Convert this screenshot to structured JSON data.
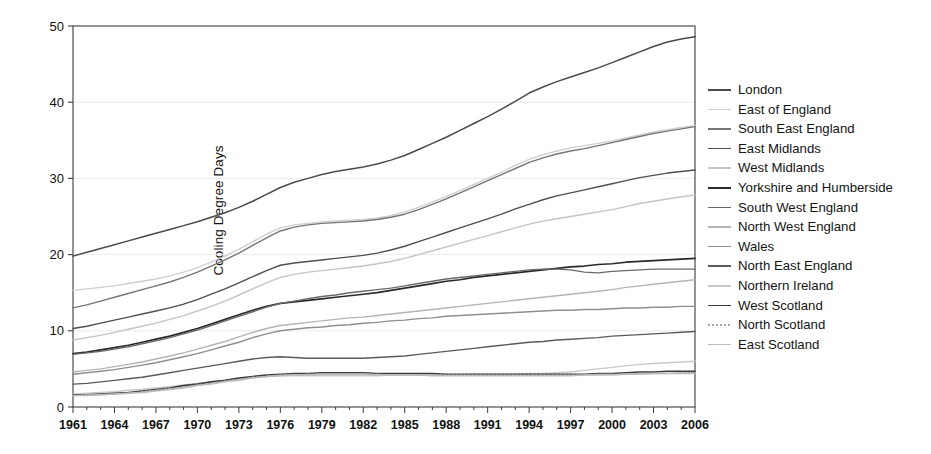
{
  "chart_data": {
    "type": "line",
    "title": "",
    "xlabel": "",
    "ylabel": "Cooling Degree Days",
    "xlim": [
      1961,
      2006
    ],
    "ylim": [
      0,
      50
    ],
    "yticks": [
      0,
      10,
      20,
      30,
      40,
      50
    ],
    "xticks": [
      1961,
      1964,
      1967,
      1970,
      1973,
      1976,
      1979,
      1982,
      1985,
      1988,
      1991,
      1994,
      1997,
      2000,
      2003,
      2006
    ],
    "grid": true,
    "legend_position": "right",
    "x": [
      1961,
      1962,
      1963,
      1964,
      1965,
      1966,
      1967,
      1968,
      1969,
      1970,
      1971,
      1972,
      1973,
      1974,
      1975,
      1976,
      1977,
      1978,
      1979,
      1980,
      1981,
      1982,
      1983,
      1984,
      1985,
      1986,
      1987,
      1988,
      1989,
      1990,
      1991,
      1992,
      1993,
      1994,
      1995,
      1996,
      1997,
      1998,
      1999,
      2000,
      2001,
      2002,
      2003,
      2004,
      2005,
      2006
    ],
    "series": [
      {
        "name": "London",
        "color": "#4a4a4a",
        "width": 1.5,
        "dash": "none",
        "values": [
          19.8,
          20.3,
          20.8,
          21.3,
          21.8,
          22.3,
          22.8,
          23.3,
          23.8,
          24.3,
          24.9,
          25.5,
          26.2,
          27.0,
          27.9,
          28.8,
          29.5,
          30.0,
          30.5,
          30.9,
          31.2,
          31.5,
          31.9,
          32.4,
          33.0,
          33.8,
          34.6,
          35.4,
          36.3,
          37.2,
          38.1,
          39.1,
          40.1,
          41.2,
          42.0,
          42.7,
          43.3,
          43.9,
          44.5,
          45.2,
          45.9,
          46.6,
          47.3,
          47.9,
          48.3,
          48.6
        ]
      },
      {
        "name": "East of England",
        "color": "#cfcfcf",
        "width": 1.4,
        "dash": "none",
        "values": [
          15.3,
          15.5,
          15.7,
          15.9,
          16.2,
          16.5,
          16.8,
          17.2,
          17.7,
          18.3,
          19.0,
          19.8,
          20.7,
          21.7,
          22.7,
          23.5,
          23.9,
          24.1,
          24.3,
          24.4,
          24.5,
          24.6,
          24.8,
          25.1,
          25.6,
          26.2,
          26.9,
          27.6,
          28.4,
          29.2,
          30.0,
          30.8,
          31.7,
          32.5,
          33.1,
          33.6,
          34.0,
          34.3,
          34.6,
          34.9,
          35.3,
          35.7,
          36.1,
          36.4,
          36.7,
          36.9
        ]
      },
      {
        "name": "South East England",
        "color": "#767676",
        "width": 1.4,
        "dash": "none",
        "values": [
          13.0,
          13.4,
          13.9,
          14.4,
          14.9,
          15.4,
          15.9,
          16.4,
          17.0,
          17.7,
          18.5,
          19.3,
          20.2,
          21.2,
          22.2,
          23.1,
          23.6,
          23.9,
          24.1,
          24.2,
          24.3,
          24.4,
          24.6,
          24.9,
          25.3,
          25.9,
          26.6,
          27.3,
          28.1,
          28.9,
          29.7,
          30.5,
          31.3,
          32.1,
          32.7,
          33.2,
          33.6,
          33.9,
          34.3,
          34.7,
          35.1,
          35.5,
          35.9,
          36.2,
          36.5,
          36.8
        ]
      },
      {
        "name": "East Midlands",
        "color": "#4f4f4f",
        "width": 1.4,
        "dash": "none",
        "values": [
          10.3,
          10.6,
          11.0,
          11.4,
          11.8,
          12.2,
          12.6,
          13.0,
          13.5,
          14.1,
          14.8,
          15.5,
          16.3,
          17.1,
          17.9,
          18.6,
          18.9,
          19.1,
          19.3,
          19.5,
          19.7,
          19.9,
          20.2,
          20.6,
          21.1,
          21.7,
          22.3,
          22.9,
          23.5,
          24.1,
          24.7,
          25.3,
          26.0,
          26.6,
          27.2,
          27.7,
          28.1,
          28.5,
          28.9,
          29.3,
          29.7,
          30.1,
          30.4,
          30.7,
          30.9,
          31.1
        ]
      },
      {
        "name": "West Midlands",
        "color": "#c4c4c4",
        "width": 1.4,
        "dash": "none",
        "values": [
          8.8,
          9.1,
          9.4,
          9.8,
          10.2,
          10.6,
          11.0,
          11.5,
          12.0,
          12.6,
          13.2,
          13.9,
          14.7,
          15.5,
          16.3,
          17.0,
          17.4,
          17.7,
          17.9,
          18.1,
          18.3,
          18.5,
          18.8,
          19.1,
          19.5,
          20.0,
          20.5,
          21.0,
          21.5,
          22.0,
          22.5,
          23.0,
          23.5,
          24.0,
          24.4,
          24.7,
          25.0,
          25.3,
          25.6,
          25.9,
          26.3,
          26.7,
          27.0,
          27.3,
          27.6,
          27.8
        ]
      },
      {
        "name": "Yorkshire and Humberside",
        "color": "#2a2a2a",
        "width": 1.7,
        "dash": "none",
        "values": [
          7.0,
          7.2,
          7.5,
          7.8,
          8.1,
          8.5,
          8.9,
          9.3,
          9.8,
          10.3,
          10.9,
          11.5,
          12.1,
          12.7,
          13.2,
          13.6,
          13.8,
          14.0,
          14.2,
          14.4,
          14.6,
          14.8,
          15.0,
          15.3,
          15.6,
          15.9,
          16.2,
          16.5,
          16.7,
          17.0,
          17.2,
          17.4,
          17.6,
          17.8,
          18.0,
          18.2,
          18.4,
          18.5,
          18.7,
          18.8,
          19.0,
          19.1,
          19.2,
          19.3,
          19.4,
          19.5
        ]
      },
      {
        "name": "South West England",
        "color": "#6a6a6a",
        "width": 1.4,
        "dash": "none",
        "values": [
          6.9,
          7.1,
          7.3,
          7.6,
          7.9,
          8.3,
          8.7,
          9.1,
          9.6,
          10.1,
          10.7,
          11.3,
          11.9,
          12.5,
          13.1,
          13.6,
          13.9,
          14.2,
          14.5,
          14.7,
          15.0,
          15.2,
          15.4,
          15.6,
          15.9,
          16.2,
          16.5,
          16.8,
          17.0,
          17.2,
          17.4,
          17.6,
          17.8,
          18.0,
          18.1,
          18.1,
          18.0,
          17.7,
          17.6,
          17.8,
          17.9,
          18.0,
          18.1,
          18.1,
          18.1,
          18.1
        ]
      },
      {
        "name": "North West England",
        "color": "#b4b4b4",
        "width": 1.4,
        "dash": "none",
        "values": [
          4.6,
          4.8,
          5.0,
          5.3,
          5.6,
          5.9,
          6.3,
          6.7,
          7.1,
          7.6,
          8.1,
          8.6,
          9.2,
          9.8,
          10.3,
          10.7,
          10.9,
          11.1,
          11.3,
          11.5,
          11.7,
          11.8,
          12.0,
          12.2,
          12.4,
          12.6,
          12.8,
          13.0,
          13.2,
          13.4,
          13.6,
          13.8,
          14.0,
          14.2,
          14.4,
          14.6,
          14.8,
          15.0,
          15.2,
          15.4,
          15.7,
          15.9,
          16.1,
          16.3,
          16.5,
          16.7
        ]
      },
      {
        "name": "Wales",
        "color": "#8e8e8e",
        "width": 1.4,
        "dash": "none",
        "values": [
          4.3,
          4.5,
          4.7,
          4.9,
          5.2,
          5.5,
          5.8,
          6.2,
          6.6,
          7.0,
          7.5,
          8.0,
          8.5,
          9.1,
          9.6,
          10.0,
          10.2,
          10.4,
          10.5,
          10.7,
          10.8,
          11.0,
          11.1,
          11.3,
          11.4,
          11.6,
          11.7,
          11.9,
          12.0,
          12.1,
          12.2,
          12.3,
          12.4,
          12.5,
          12.6,
          12.7,
          12.7,
          12.8,
          12.8,
          12.9,
          13.0,
          13.0,
          13.1,
          13.1,
          13.2,
          13.2
        ]
      },
      {
        "name": "North East England",
        "color": "#5a5a5a",
        "width": 1.4,
        "dash": "none",
        "values": [
          3.0,
          3.1,
          3.3,
          3.5,
          3.7,
          3.9,
          4.2,
          4.5,
          4.8,
          5.1,
          5.4,
          5.7,
          6.0,
          6.3,
          6.5,
          6.6,
          6.5,
          6.4,
          6.4,
          6.4,
          6.4,
          6.4,
          6.5,
          6.6,
          6.7,
          6.9,
          7.1,
          7.3,
          7.5,
          7.7,
          7.9,
          8.1,
          8.3,
          8.5,
          8.6,
          8.8,
          8.9,
          9.0,
          9.1,
          9.3,
          9.4,
          9.5,
          9.6,
          9.7,
          9.8,
          9.9
        ]
      },
      {
        "name": "Northern Ireland",
        "color": "#c9c9c9",
        "width": 1.4,
        "dash": "none",
        "values": [
          1.7,
          1.8,
          1.9,
          2.0,
          2.2,
          2.3,
          2.5,
          2.7,
          2.9,
          3.1,
          3.3,
          3.5,
          3.7,
          3.9,
          4.0,
          4.1,
          4.1,
          4.1,
          4.1,
          4.1,
          4.1,
          4.1,
          4.1,
          4.2,
          4.2,
          4.2,
          4.2,
          4.2,
          4.2,
          4.3,
          4.3,
          4.3,
          4.3,
          4.4,
          4.4,
          4.5,
          4.6,
          4.8,
          5.0,
          5.2,
          5.4,
          5.6,
          5.7,
          5.8,
          5.9,
          6.0
        ]
      },
      {
        "name": "West Scotland",
        "color": "#3d3d3d",
        "width": 1.6,
        "dash": "none",
        "values": [
          1.6,
          1.6,
          1.7,
          1.8,
          1.9,
          2.1,
          2.3,
          2.5,
          2.8,
          3.0,
          3.3,
          3.5,
          3.8,
          4.0,
          4.2,
          4.3,
          4.4,
          4.4,
          4.5,
          4.5,
          4.5,
          4.5,
          4.4,
          4.4,
          4.4,
          4.4,
          4.4,
          4.3,
          4.3,
          4.3,
          4.3,
          4.3,
          4.3,
          4.3,
          4.3,
          4.3,
          4.3,
          4.3,
          4.4,
          4.4,
          4.5,
          4.6,
          4.6,
          4.7,
          4.7,
          4.7
        ]
      },
      {
        "name": "North Scotland",
        "color": "#a8a8a8",
        "width": 1.4,
        "dash": "2,2",
        "values": [
          1.5,
          1.6,
          1.6,
          1.7,
          1.8,
          2.0,
          2.2,
          2.4,
          2.6,
          2.9,
          3.1,
          3.4,
          3.6,
          3.9,
          4.0,
          4.2,
          4.2,
          4.3,
          4.3,
          4.3,
          4.3,
          4.3,
          4.3,
          4.2,
          4.2,
          4.2,
          4.2,
          4.2,
          4.2,
          4.2,
          4.2,
          4.2,
          4.2,
          4.2,
          4.2,
          4.2,
          4.2,
          4.2,
          4.3,
          4.3,
          4.3,
          4.4,
          4.4,
          4.4,
          4.5,
          4.5
        ]
      },
      {
        "name": "East Scotland",
        "color": "#bcbcbc",
        "width": 1.4,
        "dash": "none",
        "values": [
          1.5,
          1.5,
          1.6,
          1.7,
          1.8,
          1.9,
          2.1,
          2.3,
          2.5,
          2.8,
          3.0,
          3.3,
          3.5,
          3.8,
          4.0,
          4.1,
          4.2,
          4.2,
          4.3,
          4.3,
          4.3,
          4.3,
          4.2,
          4.2,
          4.2,
          4.2,
          4.1,
          4.1,
          4.1,
          4.1,
          4.1,
          4.1,
          4.1,
          4.1,
          4.1,
          4.1,
          4.1,
          4.2,
          4.2,
          4.2,
          4.3,
          4.3,
          4.4,
          4.4,
          4.4,
          4.4
        ]
      }
    ]
  },
  "legend": {
    "items": [
      {
        "label": "London"
      },
      {
        "label": "East of England"
      },
      {
        "label": "South East England"
      },
      {
        "label": "East Midlands"
      },
      {
        "label": "West Midlands"
      },
      {
        "label": "Yorkshire and Humberside"
      },
      {
        "label": "South West England"
      },
      {
        "label": "North West England"
      },
      {
        "label": "Wales"
      },
      {
        "label": "North East England"
      },
      {
        "label": "Northern Ireland"
      },
      {
        "label": "West Scotland"
      },
      {
        "label": "North Scotland"
      },
      {
        "label": "East Scotland"
      }
    ]
  },
  "colors": {
    "background": "#ffffff",
    "axis": "#3c3c3c",
    "grid": "#ebebeb",
    "text": "#141414"
  }
}
